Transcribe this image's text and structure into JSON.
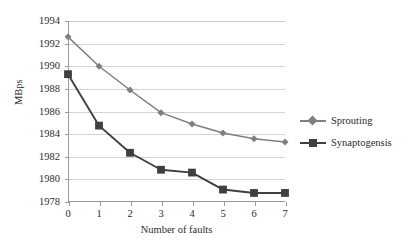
{
  "chart_data": {
    "type": "line",
    "title": "",
    "xlabel": "Number of faults",
    "ylabel": "MBps",
    "x": [
      0,
      1,
      2,
      3,
      4,
      5,
      6,
      7
    ],
    "xticklabels": [
      "0",
      "1",
      "2",
      "3",
      "4",
      "5",
      "6",
      "7"
    ],
    "yticklabels": [
      "1978",
      "1980",
      "1982",
      "1984",
      "1986",
      "1988",
      "1990",
      "1992",
      "1994"
    ],
    "yticks": [
      1978,
      1980,
      1982,
      1984,
      1986,
      1988,
      1990,
      1992,
      1994
    ],
    "xlim": [
      0,
      7
    ],
    "ylim": [
      1978,
      1994
    ],
    "grid": "horizontal",
    "legend_position": "right",
    "series": [
      {
        "name": "Sprouting",
        "marker": "diamond",
        "color": "#7f7f7f",
        "values": [
          1992.6,
          1990.0,
          1987.9,
          1985.9,
          1984.9,
          1984.1,
          1983.6,
          1983.3
        ]
      },
      {
        "name": "Synaptogensis",
        "marker": "square",
        "color": "#3f3f3f",
        "values": [
          1989.3,
          1984.75,
          1982.35,
          1980.85,
          1980.6,
          1979.1,
          1978.8,
          1978.8
        ]
      }
    ]
  },
  "colors": {
    "sprouting": "#7f7f7f",
    "synaptogensis": "#3f3f3f",
    "gridline": "#d4d4d4",
    "axis": "#9a9a9a",
    "text": "#2b2b2b",
    "background": "#ffffff"
  }
}
